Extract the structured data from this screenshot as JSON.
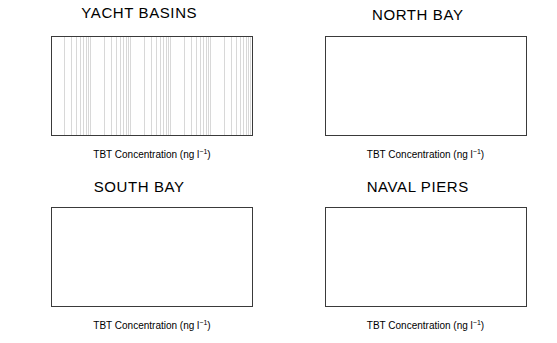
{
  "figure": {
    "x_axis_title_main": "TBT Concentration (ng l",
    "x_axis_title_sup": "−1",
    "x_axis_title_tail": ")",
    "tick_labels": [
      "0.01",
      "0.1",
      "1",
      "10",
      "100",
      "1000"
    ],
    "tick_values": [
      0.01,
      0.1,
      1,
      10,
      100,
      1000
    ],
    "footnote_marker": "b",
    "top_cut_text": ""
  },
  "chart_data": {
    "type": "bar",
    "orientation": "horizontal",
    "title": "",
    "xlabel": "TBT Concentration (ng l⁻¹)",
    "ylabel": "",
    "xscale": "log",
    "xlim": [
      0.01,
      1000
    ],
    "grid": true,
    "legend": "none",
    "categories": [
      "FEB 86",
      "OCT 86",
      "OCT 87",
      "FEB 88",
      "OCT 88",
      "JAN 89",
      "APR 89",
      "AUG 89"
    ],
    "panels": [
      {
        "name": "YACHT BASINS",
        "values": [
          40,
          45,
          40,
          58,
          21,
          62,
          8.5,
          11
        ],
        "footnotes": [
          "",
          "",
          "",
          "",
          "",
          "",
          "",
          ""
        ]
      },
      {
        "name": "NORTH BAY",
        "values": [
          null,
          6.5,
          10,
          14,
          4.2,
          11,
          4.3,
          3.0
        ],
        "footnotes": [
          "b",
          "",
          "",
          "",
          "",
          "",
          "",
          ""
        ]
      },
      {
        "name": "SOUTH BAY",
        "values": [
          null,
          4.7,
          10,
          11.5,
          4.0,
          3.9,
          1.6,
          1.0
        ],
        "footnotes": [
          "b",
          "",
          "",
          "",
          "",
          "",
          "",
          ""
        ]
      },
      {
        "name": "NAVAL PIERS",
        "values": [
          null,
          4.6,
          12,
          15,
          6.2,
          7.5,
          3.5,
          4.6
        ],
        "footnotes": [
          "b",
          "",
          "",
          "",
          "",
          "",
          "",
          ""
        ]
      }
    ]
  },
  "colors": {
    "bar": "#000000",
    "axis": "#3a3a3a",
    "major_grid": "#555555",
    "minor_grid": "#d8d8d8",
    "background": "#ffffff"
  }
}
